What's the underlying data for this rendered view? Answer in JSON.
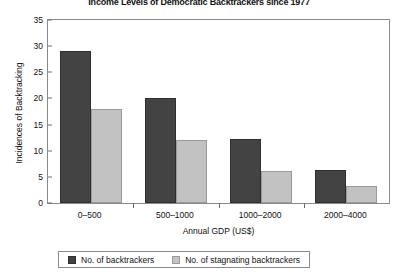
{
  "chart_data": {
    "type": "bar",
    "title": "Income Levels of Democratic Backtrackers since 1977",
    "xlabel": "Annual GDP (US$)",
    "ylabel": "Incidences of Backtracking",
    "categories": [
      "0–500",
      "500–1000",
      "1000–2000",
      "2000–4000"
    ],
    "series": [
      {
        "name": "No. of backtrackers",
        "color": "#434343",
        "values": [
          29,
          20,
          12.3,
          6.3
        ]
      },
      {
        "name": "No. of stagnating backtrackers",
        "color": "#c2c2c2",
        "values": [
          18,
          12,
          6.2,
          3.3
        ]
      }
    ],
    "ylim": [
      0,
      35
    ],
    "yticks": [
      0,
      5,
      10,
      15,
      20,
      25,
      30,
      35
    ],
    "ytick_labels": [
      "0",
      "5",
      "10",
      "15",
      "20",
      "25",
      "30",
      "35"
    ],
    "grid": false,
    "legend_position": "bottom"
  }
}
